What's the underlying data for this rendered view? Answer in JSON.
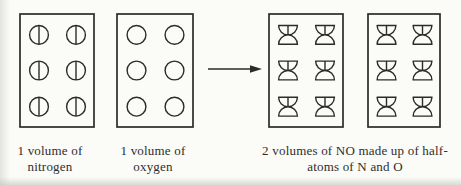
{
  "diagram": {
    "ink_color": "#2b2b2b",
    "paper_color": "#fbfbf8",
    "boxes": [
      {
        "name": "nitrogen-volume-box",
        "particle": "nitrogen-atom-icon",
        "rows": 3,
        "cols": 2,
        "count": 6
      },
      {
        "name": "oxygen-volume-box",
        "particle": "oxygen-atom-icon",
        "rows": 3,
        "cols": 2,
        "count": 6
      },
      {
        "name": "no-volume-box-1",
        "particle": "no-half-atoms-molecule-icon",
        "rows": 3,
        "cols": 2,
        "count": 6
      },
      {
        "name": "no-volume-box-2",
        "particle": "no-half-atoms-molecule-icon",
        "rows": 3,
        "cols": 2,
        "count": 6
      }
    ],
    "arrow": {
      "direction": "right"
    },
    "captions": {
      "nitrogen": [
        "1 volume of",
        "nitrogen"
      ],
      "oxygen": [
        "1 volume of",
        "oxygen"
      ],
      "product": [
        "2 volumes of NO made up of half-",
        "atoms of N and O"
      ]
    }
  }
}
